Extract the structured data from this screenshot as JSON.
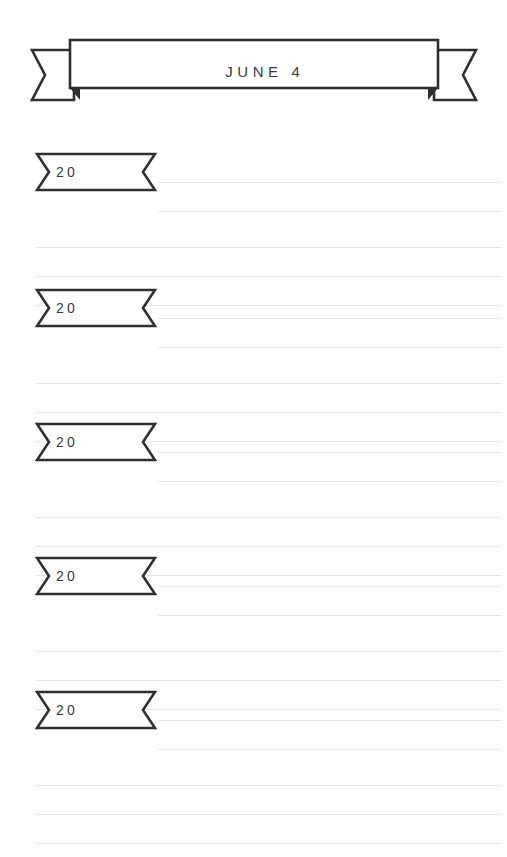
{
  "page": {
    "background_color": "#ffffff",
    "ink_color": "#2f2f33",
    "rule_color": "#e6e6e8",
    "text_color": "#3b3b3f"
  },
  "header": {
    "title": "JUNE 4",
    "banner_shape": "ribbon-banner-with-forked-tails"
  },
  "entries": [
    {
      "year_label": "20",
      "ribbon_shape": "ribbon-flag-notched",
      "top": 152,
      "short_rules": [
        30,
        59
      ],
      "full_rules": [
        95,
        124,
        153
      ]
    },
    {
      "year_label": "20",
      "ribbon_shape": "ribbon-flag-notched",
      "top": 288,
      "short_rules": [
        30,
        59
      ],
      "full_rules": [
        95,
        124,
        153
      ]
    },
    {
      "year_label": "20",
      "ribbon_shape": "ribbon-flag-notched",
      "top": 422,
      "short_rules": [
        30,
        59
      ],
      "full_rules": [
        95,
        124,
        153
      ]
    },
    {
      "year_label": "20",
      "ribbon_shape": "ribbon-flag-notched",
      "top": 556,
      "short_rules": [
        30,
        59
      ],
      "full_rules": [
        95,
        124,
        153
      ]
    },
    {
      "year_label": "20",
      "ribbon_shape": "ribbon-flag-notched",
      "top": 690,
      "short_rules": [
        30,
        59
      ],
      "full_rules": [
        95,
        124,
        153
      ]
    }
  ]
}
